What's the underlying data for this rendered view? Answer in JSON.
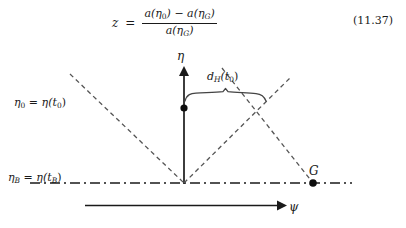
{
  "equation": {
    "lhs": "z",
    "relation": "=",
    "numerator_first": "a(η",
    "numerator_sub0": "0",
    "numerator_mid": ") − a(η",
    "numerator_subG": "G",
    "numerator_end": ")",
    "denominator_first": "a(η",
    "denominator_subG": "G",
    "denominator_end": ")",
    "number": "(11.37)"
  },
  "diagram": {
    "y_axis_label": "η",
    "x_axis_label": "ψ",
    "point_G_label": "G",
    "horizon_label_main": "d",
    "horizon_label_sub": "H",
    "horizon_label_arg": "(t",
    "horizon_label_argsub": "0",
    "horizon_label_close": ")",
    "eta0_label_lhs": "η",
    "eta0_label_lhs_sub": "0",
    "eta0_label_rel": " = ",
    "eta0_label_rhs": "η(t",
    "eta0_label_rhs_sub": "0",
    "eta0_label_close": ")",
    "etaB_label_lhs": "η",
    "etaB_label_lhs_sub": "B",
    "etaB_label_rel": " = ",
    "etaB_label_rhs": "η(t",
    "etaB_label_rhs_sub": "B",
    "etaB_label_close": ")",
    "colors": {
      "ink": "#1a1a1a",
      "dashed": "#555555",
      "brace": "#444444"
    }
  }
}
